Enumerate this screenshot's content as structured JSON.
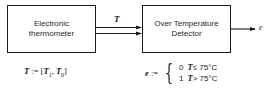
{
  "diagram": {
    "blocks": [
      {
        "id": "thermometer",
        "line1": "Electronic",
        "line2": "thermometer"
      },
      {
        "id": "detector",
        "line1": "Over Temperature",
        "line2": "Detector"
      }
    ],
    "connections": [
      {
        "from": "thermometer",
        "to": "detector",
        "label": "T",
        "style": "double-arrow"
      },
      {
        "from": "detector",
        "to": "output",
        "label": "e",
        "style": "single-arrow"
      }
    ],
    "equations": {
      "T_def": {
        "lhs": "T",
        "assign": ":=",
        "open": "[",
        "var1": "T",
        "sub1": "1",
        "sep": ",",
        "var2": "T",
        "sub2": "0",
        "close": "]"
      },
      "e_def": {
        "lhs": "e",
        "assign": ":=",
        "brace": "{",
        "cases": [
          {
            "value": "0",
            "var": "T",
            "cond": "≤ 75°C"
          },
          {
            "value": "1",
            "var": "T",
            "cond": "> 75°C"
          }
        ]
      }
    },
    "colors": {
      "stroke": "#1a1a1a",
      "background": "#ffffff"
    }
  }
}
